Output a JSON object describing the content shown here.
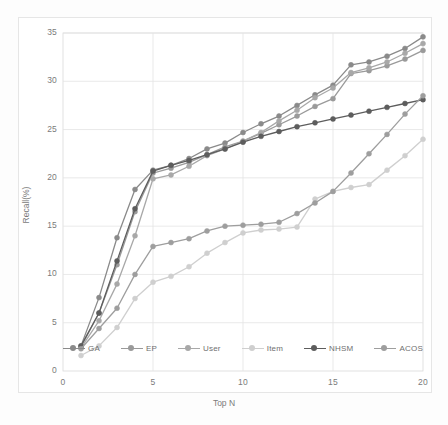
{
  "chart_data": {
    "type": "line",
    "title": "",
    "xlabel": "Top N",
    "ylabel": "Recall(%)",
    "xlim": [
      0,
      20
    ],
    "ylim": [
      0,
      35
    ],
    "xticks": [
      0,
      5,
      10,
      15,
      20
    ],
    "yticks": [
      0,
      5,
      10,
      15,
      20,
      25,
      30,
      35
    ],
    "grid": true,
    "legend_position": "bottom",
    "x": [
      1,
      2,
      3,
      4,
      5,
      6,
      7,
      8,
      9,
      10,
      11,
      12,
      13,
      14,
      15,
      16,
      17,
      18,
      19,
      20
    ],
    "series": [
      {
        "name": "GA",
        "color": "#8a8a8a",
        "values": [
          2.6,
          7.6,
          13.8,
          18.8,
          20.8,
          21.3,
          22.0,
          23.0,
          23.6,
          24.7,
          25.6,
          26.4,
          27.5,
          28.6,
          29.6,
          31.7,
          32.0,
          32.6,
          33.4,
          34.6
        ]
      },
      {
        "name": "EP",
        "color": "#9a9a9a",
        "values": [
          2.5,
          6.0,
          11.0,
          16.5,
          20.5,
          21.0,
          21.6,
          22.4,
          23.2,
          23.8,
          24.6,
          25.5,
          26.4,
          27.4,
          28.2,
          30.8,
          31.1,
          31.6,
          32.3,
          33.2
        ]
      },
      {
        "name": "User",
        "color": "#a8a8a8",
        "values": [
          2.4,
          5.2,
          9.0,
          14.0,
          19.9,
          20.3,
          21.2,
          22.3,
          23.0,
          23.8,
          24.7,
          25.9,
          27.0,
          28.3,
          29.3,
          30.9,
          31.4,
          32.0,
          32.9,
          33.9
        ]
      },
      {
        "name": "Item",
        "color": "#cfcfcf",
        "values": [
          1.6,
          2.6,
          4.5,
          7.5,
          9.2,
          9.8,
          10.8,
          12.2,
          13.3,
          14.3,
          14.6,
          14.7,
          14.9,
          17.8,
          18.6,
          19.0,
          19.3,
          20.8,
          22.3,
          24.0
        ]
      },
      {
        "name": "NHSM",
        "color": "#5d5d5d",
        "values": [
          2.6,
          6.0,
          11.4,
          16.8,
          20.7,
          21.3,
          21.8,
          22.4,
          23.0,
          23.7,
          24.3,
          24.8,
          25.3,
          25.7,
          26.1,
          26.5,
          26.9,
          27.3,
          27.7,
          28.1
        ]
      },
      {
        "name": "ACOS",
        "color": "#9e9e9e",
        "values": [
          2.3,
          4.4,
          6.5,
          10.0,
          12.9,
          13.3,
          13.7,
          14.5,
          15.0,
          15.1,
          15.2,
          15.4,
          16.3,
          17.4,
          18.6,
          20.5,
          22.5,
          24.5,
          26.6,
          28.5
        ]
      }
    ]
  },
  "axis": {
    "ylabel": "Recall(%)",
    "xlabel": "Top N",
    "yticks": [
      "0",
      "5",
      "10",
      "15",
      "20",
      "25",
      "30",
      "35"
    ],
    "xticks": [
      "0",
      "5",
      "10",
      "15",
      "20"
    ]
  },
  "legend": {
    "items": [
      {
        "label": "GA"
      },
      {
        "label": "EP"
      },
      {
        "label": "User"
      },
      {
        "label": "Item"
      },
      {
        "label": "NHSM"
      },
      {
        "label": "ACOS"
      }
    ]
  }
}
